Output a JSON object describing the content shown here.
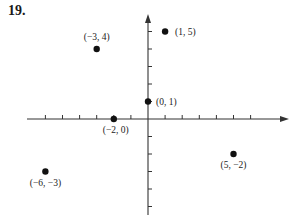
{
  "problem_number": "19.",
  "chart_data": {
    "type": "scatter",
    "title": "",
    "xlabel": "",
    "ylabel": "",
    "grid": false,
    "xlim": [
      -7,
      8
    ],
    "ylim": [
      -5,
      6
    ],
    "x_ticks": [
      -6,
      -5,
      -4,
      -3,
      -2,
      -1,
      1,
      2,
      3,
      4,
      5,
      6
    ],
    "y_ticks": [
      -5,
      -4,
      -3,
      -2,
      -1,
      1,
      2,
      3,
      4,
      5
    ],
    "points": [
      {
        "x": 1,
        "y": 5,
        "label": "(1, 5)"
      },
      {
        "x": -3,
        "y": 4,
        "label": "(−3, 4)"
      },
      {
        "x": 0,
        "y": 1,
        "label": "(0, 1)"
      },
      {
        "x": -2,
        "y": 0,
        "label": "(−2, 0)"
      },
      {
        "x": -6,
        "y": -3,
        "label": "(−6, −3)"
      },
      {
        "x": 5,
        "y": -2,
        "label": "(5, −2)"
      }
    ]
  }
}
